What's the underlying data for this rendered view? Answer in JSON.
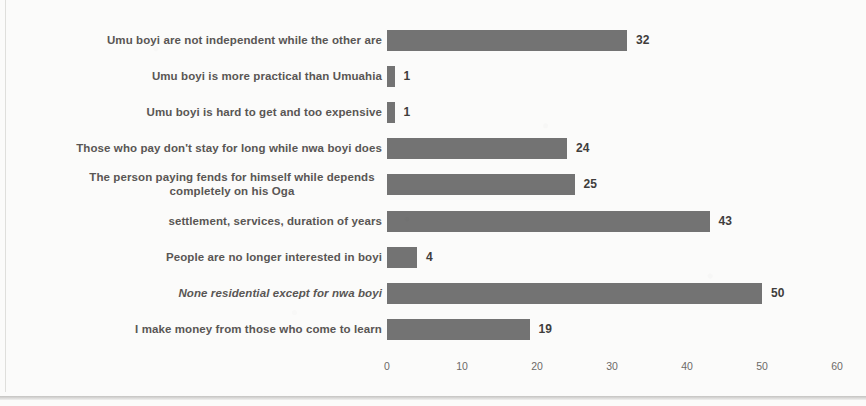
{
  "chart_data": {
    "type": "bar",
    "orientation": "horizontal",
    "title": "",
    "subtitle": "",
    "xlabel": "",
    "ylabel": "",
    "xlim": [
      0,
      60
    ],
    "xticks": [
      0,
      10,
      20,
      30,
      40,
      50,
      60
    ],
    "xtick_labels": [
      "0",
      "10",
      "20",
      "30",
      "40",
      "50",
      "60"
    ],
    "grid": false,
    "legend": false,
    "bar_color": "#737373",
    "categories": [
      "Umu boyi are not independent while the other are",
      "Umu boyi is more practical than Umuahia",
      "Umu boyi is hard to get and too expensive",
      "Those who pay don't stay for long while nwa boyi does",
      "The person paying fends for himself while depends\ncompletely on his Oga",
      "settlement, services, duration of years",
      "People are no longer interested in boyi",
      "None residential except for nwa boyi",
      "I make money from those who come to learn"
    ],
    "values": [
      32,
      1,
      1,
      24,
      25,
      43,
      4,
      50,
      19
    ],
    "value_labels": [
      "32",
      "1",
      "1",
      "24",
      "25",
      "43",
      "4",
      "50",
      "19"
    ]
  }
}
